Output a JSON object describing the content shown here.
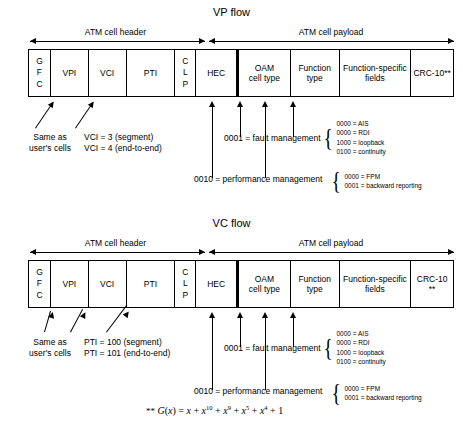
{
  "figure": {
    "footnote": "** G(x) = x + x 10 + x 9 + x 5 + x 4 + 1",
    "footnote_marker": "**"
  },
  "flows": [
    {
      "id": "vp",
      "title": "VP flow",
      "spans": [
        {
          "label": "ATM cell header"
        },
        {
          "label": "ATM cell payload"
        }
      ],
      "header_cells": [
        {
          "name": "gfc",
          "label": "G\nF\nC"
        },
        {
          "name": "vpi",
          "label": "VPI"
        },
        {
          "name": "vci",
          "label": "VCI"
        },
        {
          "name": "pti",
          "label": "PTI"
        },
        {
          "name": "clp",
          "label": "C\nL\nP"
        },
        {
          "name": "hec",
          "label": "HEC"
        }
      ],
      "payload_cells": [
        {
          "name": "oam-cell-type",
          "label": "OAM\ncell type"
        },
        {
          "name": "function-type",
          "label": "Function\ntype"
        },
        {
          "name": "function-specific-fields",
          "label": "Function-specific\nfields"
        },
        {
          "name": "crc",
          "label": "CRC-10**"
        }
      ],
      "notes": [
        {
          "name": "same-as-user-cells",
          "text": "Same as\nuser's cells"
        },
        {
          "name": "vci-values",
          "text": "VCI = 3 (segment)\nVCI = 4 (end-to-end)"
        }
      ],
      "oam_types": [
        {
          "name": "fault-management",
          "label": "0001 = fault management",
          "items": [
            "0000 = AIS",
            "0000 = RDI",
            "1000 = loopback",
            "0100 = continuity"
          ]
        },
        {
          "name": "performance-management",
          "label": "0010 = performance management",
          "items": [
            "0000 = FPM",
            "0001 = backward reporting"
          ]
        }
      ]
    },
    {
      "id": "vc",
      "title": "VC flow",
      "spans": [
        {
          "label": "ATM cell header"
        },
        {
          "label": "ATM cell payload"
        }
      ],
      "header_cells": [
        {
          "name": "gfc",
          "label": "G\nF\nC"
        },
        {
          "name": "vpi",
          "label": "VPI"
        },
        {
          "name": "vci",
          "label": "VCI"
        },
        {
          "name": "pti",
          "label": "PTI"
        },
        {
          "name": "clp",
          "label": "C\nL\nP"
        },
        {
          "name": "hec",
          "label": "HEC"
        }
      ],
      "payload_cells": [
        {
          "name": "oam-cell-type",
          "label": "OAM\ncell type"
        },
        {
          "name": "function-type",
          "label": "Function\ntype"
        },
        {
          "name": "function-specific-fields",
          "label": "Function-specific\nfields"
        },
        {
          "name": "crc",
          "label": "CRC-10\n**"
        }
      ],
      "notes": [
        {
          "name": "same-as-user-cells",
          "text": "Same as\nuser's cells"
        },
        {
          "name": "pti-values",
          "text": "PTI = 100 (segment)\nPTI = 101 (end-to-end)"
        }
      ],
      "oam_types": [
        {
          "name": "fault-management",
          "label": "0001 = fault management",
          "items": [
            "0000 = AIS",
            "0000 = RDI",
            "1000 = loopback",
            "0100 = continuity"
          ]
        },
        {
          "name": "performance-management",
          "label": "0010 = performance management",
          "items": [
            "0000 = FPM",
            "0001 = backward reporting"
          ]
        }
      ]
    }
  ]
}
